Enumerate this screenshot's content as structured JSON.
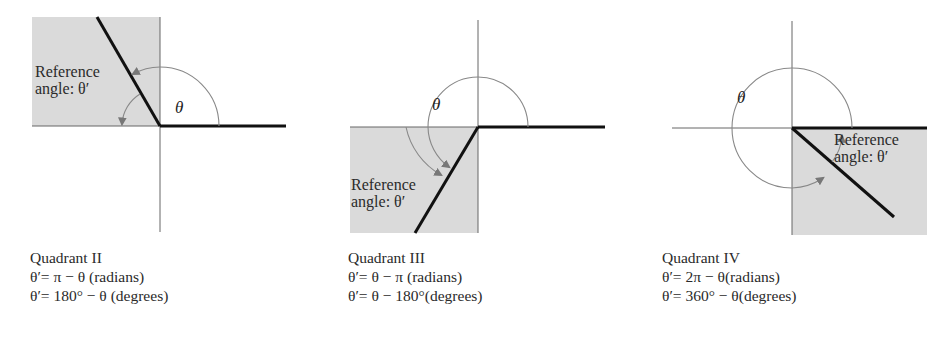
{
  "figures": [
    {
      "quadrant": "Quadrant II",
      "ref_label_line1": "Reference",
      "ref_label_line2": "angle: θ′",
      "theta_label": "θ",
      "formula_radians": "θ′= π − θ (radians)",
      "formula_degrees": "θ′= 180° − θ (degrees)"
    },
    {
      "quadrant": "Quadrant III",
      "ref_label_line1": "Reference",
      "ref_label_line2": "angle: θ′",
      "theta_label": "θ",
      "formula_radians": "θ′=  θ − π (radians)",
      "formula_degrees": "θ′=  θ − 180°(degrees)"
    },
    {
      "quadrant": "Quadrant IV",
      "ref_label_line1": "Reference",
      "ref_label_line2": "angle: θ′",
      "theta_label": "θ",
      "formula_radians": "θ′= 2π − θ(radians)",
      "formula_degrees": "θ′= 360° − θ(degrees)"
    }
  ],
  "colors": {
    "shade": "#dadada",
    "terminal_ray": "#111111",
    "axis": "#666666",
    "arc": "#888888"
  }
}
